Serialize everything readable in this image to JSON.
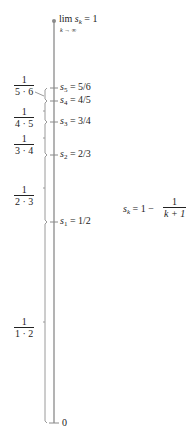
{
  "colors": {
    "axis": "#8a8a8a",
    "brace": "#9a9a9a",
    "text": "#222222",
    "background": "#ffffff"
  },
  "axis": {
    "bottom_label": "0",
    "top_label": {
      "lim": "lim",
      "var": "s",
      "var_sub": "k",
      "under": "k → ∞",
      "eq": "= 1"
    }
  },
  "partial_sums": [
    {
      "name": "s",
      "sub": "1",
      "value": "1/2",
      "y": 0.5
    },
    {
      "name": "s",
      "sub": "2",
      "value": "2/3",
      "y": 0.6667
    },
    {
      "name": "s",
      "sub": "3",
      "value": "3/4",
      "y": 0.75
    },
    {
      "name": "s",
      "sub": "4",
      "value": "4/5",
      "y": 0.8
    },
    {
      "name": "s",
      "sub": "5",
      "value": "5/6",
      "y": 0.8333
    }
  ],
  "term_labels": [
    {
      "num": "1",
      "den": "1 · 2"
    },
    {
      "num": "1",
      "den": "2 · 3"
    },
    {
      "num": "1",
      "den": "3 · 4"
    },
    {
      "num": "1",
      "den": "4 · 5"
    },
    {
      "num": "1",
      "den": "5 · 6"
    }
  ],
  "formula": {
    "lhs": "s",
    "lhs_sub": "k",
    "eq": "= 1 −",
    "num": "1",
    "den": "k + 1"
  }
}
